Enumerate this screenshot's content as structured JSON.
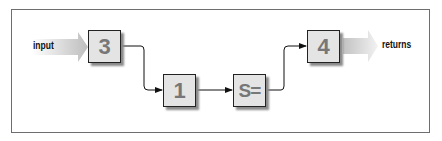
{
  "diagram": {
    "input_label": "input",
    "output_label": "returns",
    "nodes": [
      {
        "id": "n3",
        "label": "3"
      },
      {
        "id": "n1",
        "label": "1"
      },
      {
        "id": "nS",
        "label": "S="
      },
      {
        "id": "n4",
        "label": "4"
      }
    ],
    "edges": [
      {
        "from": "input",
        "to": "n3"
      },
      {
        "from": "n3",
        "to": "n1"
      },
      {
        "from": "n1",
        "to": "nS"
      },
      {
        "from": "nS",
        "to": "n4"
      },
      {
        "from": "n4",
        "to": "returns"
      }
    ],
    "colors": {
      "box_fill": "#e4e4e4",
      "box_text": "#777777",
      "arrow_band": "#c8c8c8",
      "frame": "#6e6e6e"
    }
  }
}
